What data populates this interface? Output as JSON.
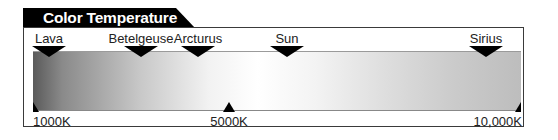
{
  "title": "Color Temperature",
  "colors": {
    "tab_background": "#000000",
    "tab_text": "#ffffff",
    "frame_border": "#3a3a3a",
    "gradient_start": "#5a5a5a",
    "gradient_peak": "#ffffff",
    "gradient_end": "#bdbdbd"
  },
  "stars": [
    {
      "name": "Lava",
      "x": 49
    },
    {
      "name": "Betelgeuse",
      "x": 141
    },
    {
      "name": "Arcturus",
      "x": 198
    },
    {
      "name": "Sun",
      "x": 287
    },
    {
      "name": "Sirius",
      "x": 486
    }
  ],
  "scale": [
    {
      "label": "1000K",
      "x": 33
    },
    {
      "label": "5000K",
      "x": 229
    },
    {
      "label": "10,000K",
      "x": 521
    }
  ]
}
